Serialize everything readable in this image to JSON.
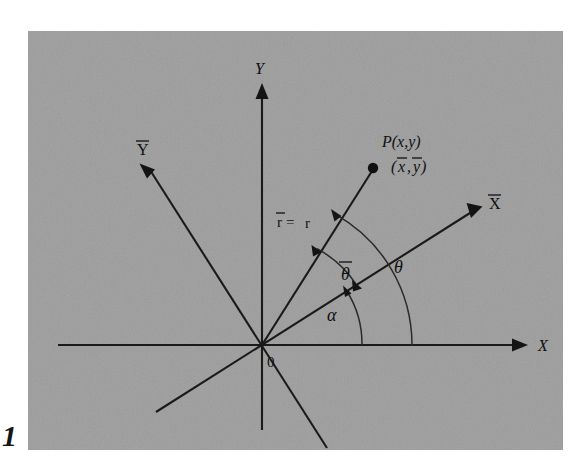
{
  "figure": {
    "kind": "math-diagram",
    "plate_color": "#9d9d9d",
    "ink_color": "#141414",
    "page_margin_mark": "1"
  },
  "labels": {
    "y_axis": "Y",
    "x_axis": "X",
    "y_bar_axis": "Y",
    "x_bar_axis": "X",
    "origin": "0",
    "point_primary": "P(x,y)",
    "point_secondary_open": "(",
    "point_secondary_x": "x",
    "point_secondary_comma": ",",
    "point_secondary_y": "y",
    "point_secondary_close": ")",
    "radius_bar": "r",
    "radius_equals": " = ",
    "radius_plain": "r",
    "theta_bar": "θ",
    "theta": "θ",
    "alpha": "α"
  },
  "geometry": {
    "origin": {
      "x": 262,
      "y": 345
    },
    "x_axis": {
      "start_x": 58,
      "end_x": 516,
      "y": 345
    },
    "y_axis": {
      "x": 262,
      "top_y": 96,
      "bottom_y": 430
    },
    "x_bar_axis": {
      "angle_deg": 32.3,
      "arrow_len": 254,
      "back_len": 125
    },
    "y_bar_axis": {
      "angle_deg": 122.3,
      "arrow_len": 222,
      "back_len": 122
    },
    "r_vector": {
      "angle_deg": 60.5,
      "length": 205
    },
    "arc_alpha": {
      "radius": 100,
      "from_deg": 0,
      "to_deg": 32.3
    },
    "arc_theta": {
      "radius": 150,
      "from_deg": 0,
      "to_deg": 60.5
    },
    "arc_theta_bar": {
      "radius": 112,
      "from_deg": 32.3,
      "to_deg": 60.5
    },
    "point_P": {
      "x": 373,
      "y": 168
    }
  },
  "annotations": {
    "angles": [
      {
        "name": "alpha",
        "symbol": "α",
        "between": "X axis and X-bar axis",
        "value_deg": 32
      },
      {
        "name": "theta",
        "symbol": "θ",
        "between": "X axis and radius vector",
        "value_deg": 61
      },
      {
        "name": "theta-bar",
        "symbol": "θ",
        "between": "X-bar axis and radius vector",
        "value_deg": 28
      }
    ],
    "relation": "r-bar = r"
  }
}
